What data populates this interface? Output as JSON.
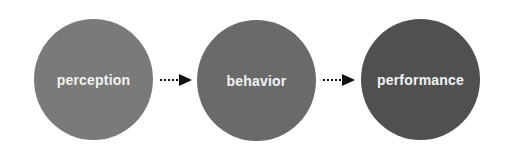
{
  "nodes": [
    {
      "label": "perception",
      "color": "#7a7a7a"
    },
    {
      "label": "behavior",
      "color": "#6a6a6a"
    },
    {
      "label": "performance",
      "color": "#505050"
    }
  ],
  "arrows": [
    {
      "from": "perception",
      "to": "behavior",
      "style": "dotted"
    },
    {
      "from": "behavior",
      "to": "performance",
      "style": "dotted"
    }
  ]
}
